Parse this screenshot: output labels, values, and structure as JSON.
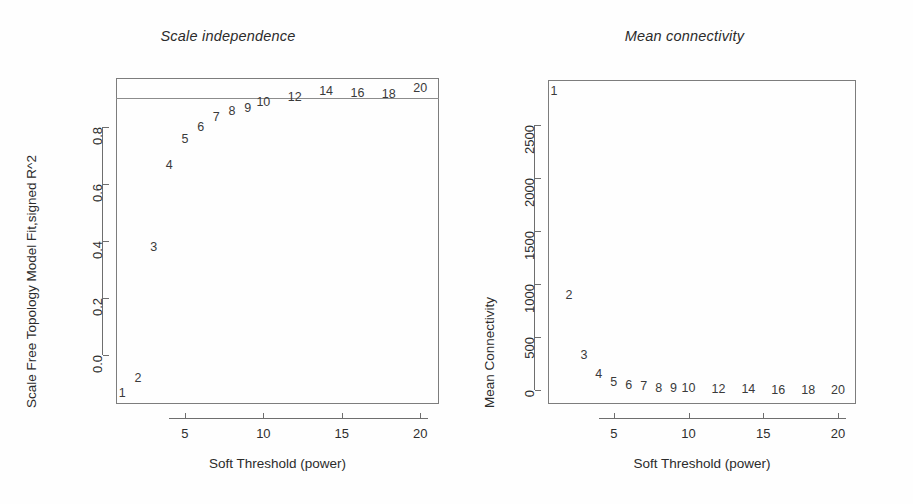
{
  "figure": {
    "background_color": "#fefefe",
    "axis_color": "#6e6e6e",
    "text_color": "#2e2e2e",
    "point_label_color": "#3a3a3a"
  },
  "panels": [
    {
      "key": "scale_independence",
      "title": "Scale independence",
      "xlabel": "Soft Threshold (power)",
      "ylabel": "Scale Free Topology Model Fit,signed R^2",
      "xticks": [
        "5",
        "10",
        "15",
        "20"
      ],
      "yticks": [
        "0.0",
        "0.2",
        "0.4",
        "0.6",
        "0.8"
      ]
    },
    {
      "key": "mean_connectivity",
      "title": "Mean connectivity",
      "xlabel": "Soft Threshold (power)",
      "ylabel": "Mean Connectivity",
      "xticks": [
        "5",
        "10",
        "15",
        "20"
      ],
      "yticks": [
        "0",
        "500",
        "1000",
        "1500",
        "2000",
        "2500"
      ]
    }
  ],
  "chart_data": [
    {
      "type": "scatter",
      "title": "Scale independence",
      "xlabel": "Soft Threshold (power)",
      "ylabel": "Scale Free Topology Model Fit,signed R^2",
      "xlim": [
        0.6,
        21.2
      ],
      "ylim": [
        -0.17,
        0.97
      ],
      "xticks": [
        5,
        10,
        15,
        20
      ],
      "yticks": [
        0.0,
        0.2,
        0.4,
        0.6,
        0.8
      ],
      "grid": false,
      "legend": null,
      "marker_style": "text-labels",
      "reference_line": {
        "orientation": "horizontal",
        "y": 0.9,
        "color": "#8c8c8c"
      },
      "x": [
        1,
        2,
        3,
        4,
        5,
        6,
        7,
        8,
        9,
        10,
        12,
        14,
        16,
        18,
        20
      ],
      "y": [
        -0.13,
        -0.08,
        0.38,
        0.665,
        0.755,
        0.8,
        0.835,
        0.855,
        0.865,
        0.885,
        0.905,
        0.925,
        0.918,
        0.915,
        0.935
      ],
      "labels": [
        "1",
        "2",
        "3",
        "4",
        "5",
        "6",
        "7",
        "8",
        "9",
        "10",
        "12",
        "14",
        "16",
        "18",
        "20"
      ]
    },
    {
      "type": "scatter",
      "title": "Mean connectivity",
      "xlabel": "Soft Threshold (power)",
      "ylabel": "Mean Connectivity",
      "xlim": [
        0.6,
        21.2
      ],
      "ylim": [
        -130,
        2920
      ],
      "xticks": [
        5,
        10,
        15,
        20
      ],
      "yticks": [
        0,
        500,
        1000,
        1500,
        2000,
        2500
      ],
      "grid": false,
      "legend": null,
      "marker_style": "text-labels",
      "x": [
        1,
        2,
        3,
        4,
        5,
        6,
        7,
        8,
        9,
        10,
        12,
        14,
        16,
        18,
        20
      ],
      "y": [
        2820,
        900,
        330,
        150,
        80,
        50,
        35,
        25,
        20,
        16,
        10,
        7,
        5,
        4,
        3
      ],
      "labels": [
        "1",
        "2",
        "3",
        "4",
        "5",
        "6",
        "7",
        "8",
        "9",
        "10",
        "12",
        "14",
        "16",
        "18",
        "20"
      ]
    }
  ]
}
